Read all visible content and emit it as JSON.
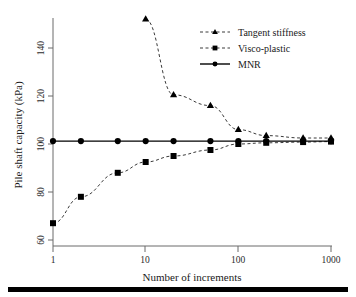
{
  "chart_data": {
    "type": "line",
    "title": "",
    "xlabel": "Number of increments",
    "ylabel": "Pile shaft capacity  (kPa)",
    "xscale": "log",
    "xlim": [
      1,
      1000
    ],
    "ylim": [
      60,
      152
    ],
    "xticks": [
      1,
      10,
      100,
      1000
    ],
    "xticklabels": [
      "1",
      "10",
      "100",
      "1000"
    ],
    "yticks": [
      60,
      80,
      100,
      120,
      140
    ],
    "yticklabels": [
      "60",
      "80",
      "100",
      "120",
      "140"
    ],
    "grid": false,
    "legend_position": "upper right",
    "series": [
      {
        "name": "Tangent stiffness",
        "marker": "triangle",
        "linestyle": "dashed",
        "color": "#000000",
        "x": [
          10,
          20,
          50,
          100,
          200,
          500,
          1000
        ],
        "y": [
          152,
          120.5,
          116,
          106,
          103.5,
          102.5,
          102.5
        ]
      },
      {
        "name": "Visco-plastic",
        "marker": "square",
        "linestyle": "dashed",
        "color": "#000000",
        "x": [
          1,
          2,
          5,
          10,
          20,
          50,
          100,
          200,
          500,
          1000
        ],
        "y": [
          67,
          78,
          88,
          92.5,
          95,
          97.5,
          100,
          100.5,
          100.8,
          101
        ]
      },
      {
        "name": "MNR",
        "marker": "circle",
        "linestyle": "solid",
        "color": "#000000",
        "x": [
          1,
          2,
          5,
          10,
          20,
          50,
          100,
          200,
          500,
          1000
        ],
        "y": [
          101.2,
          101.2,
          101.2,
          101.2,
          101.2,
          101.2,
          101.2,
          101.2,
          101.2,
          101.2
        ]
      }
    ]
  },
  "legend": {
    "entries": [
      {
        "label": "Tangent stiffness",
        "marker": "triangle-icon",
        "line": "dashed"
      },
      {
        "label": "Visco-plastic",
        "marker": "square-icon",
        "line": "dashed"
      },
      {
        "label": "MNR",
        "marker": "circle-icon",
        "line": "solid"
      }
    ]
  },
  "axes": {
    "x_label": "Number of increments",
    "y_label": "Pile shaft capacity  (kPa)",
    "x_tick_labels": [
      "1",
      "10",
      "100",
      "1000"
    ],
    "y_tick_labels": [
      "60",
      "80",
      "100",
      "120",
      "140"
    ]
  },
  "colors": {
    "ink": "#000000",
    "axis": "#6a6a6a",
    "dashed_series": "#3a3a3a",
    "background": "#ffffff",
    "bottom_rule": "#000000"
  }
}
